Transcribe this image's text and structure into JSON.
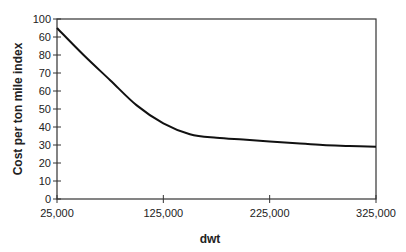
{
  "chart_data": {
    "type": "line",
    "title": "",
    "xlabel": "dwt",
    "ylabel": "Cost per ton mile index",
    "xlim": [
      25000,
      325000
    ],
    "ylim": [
      0,
      100
    ],
    "x_ticks": [
      "25,000",
      "125,000",
      "225,000",
      "325,000"
    ],
    "y_ticks": [
      "0",
      "10",
      "20",
      "30",
      "40",
      "50",
      "60",
      "70",
      "80",
      "60",
      "100"
    ],
    "grid": false,
    "legend": null,
    "series": [
      {
        "name": "Cost per ton mile index",
        "x": [
          25000,
          50000,
          75000,
          100000,
          125000,
          150000,
          175000,
          200000,
          225000,
          250000,
          275000,
          300000,
          325000
        ],
        "values": [
          95,
          80,
          66,
          52,
          42,
          36,
          34,
          33,
          32,
          31,
          30,
          29.5,
          29
        ]
      }
    ]
  }
}
